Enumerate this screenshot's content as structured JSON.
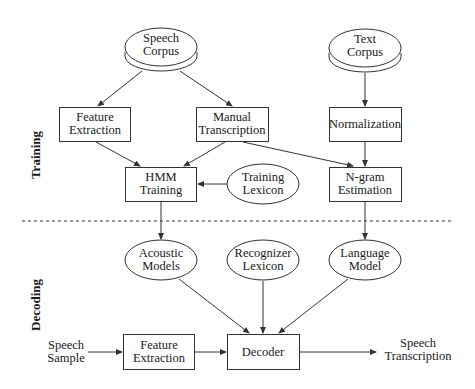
{
  "sections": {
    "training_label": "Training",
    "decoding_label": "Decoding"
  },
  "nodes": {
    "speech_corpus": {
      "line1": "Speech",
      "line2": "Corpus",
      "shape": "cylinder"
    },
    "text_corpus": {
      "line1": "Text",
      "line2": "Corpus",
      "shape": "cylinder"
    },
    "feature_extraction_train": {
      "line1": "Feature",
      "line2": "Extraction",
      "shape": "box"
    },
    "manual_transcription": {
      "line1": "Manual",
      "line2": "Transcription",
      "shape": "box"
    },
    "normalization": {
      "line1": "Normalization",
      "shape": "box"
    },
    "hmm_training": {
      "line1": "HMM",
      "line2": "Training",
      "shape": "box"
    },
    "training_lexicon": {
      "line1": "Training",
      "line2": "Lexicon",
      "shape": "ellipse"
    },
    "ngram_estimation": {
      "line1": "N-gram",
      "line2": "Estimation",
      "shape": "box"
    },
    "acoustic_models": {
      "line1": "Acoustic",
      "line2": "Models",
      "shape": "ellipse"
    },
    "recognizer_lexicon": {
      "line1": "Recognizer",
      "line2": "Lexicon",
      "shape": "ellipse"
    },
    "language_model": {
      "line1": "Language",
      "line2": "Model",
      "shape": "ellipse"
    },
    "speech_sample": {
      "line1": "Speech",
      "line2": "Sample",
      "shape": "text"
    },
    "feature_extraction_decode": {
      "line1": "Feature",
      "line2": "Extraction",
      "shape": "box"
    },
    "decoder": {
      "line1": "Decoder",
      "shape": "box"
    },
    "speech_transcription": {
      "line1": "Speech",
      "line2": "Transcription",
      "shape": "text"
    }
  },
  "edges": [
    [
      "speech_corpus",
      "feature_extraction_train"
    ],
    [
      "speech_corpus",
      "manual_transcription"
    ],
    [
      "text_corpus",
      "normalization"
    ],
    [
      "feature_extraction_train",
      "hmm_training"
    ],
    [
      "manual_transcription",
      "hmm_training"
    ],
    [
      "manual_transcription",
      "ngram_estimation"
    ],
    [
      "training_lexicon",
      "hmm_training"
    ],
    [
      "normalization",
      "ngram_estimation"
    ],
    [
      "hmm_training",
      "acoustic_models"
    ],
    [
      "ngram_estimation",
      "language_model"
    ],
    [
      "acoustic_models",
      "decoder"
    ],
    [
      "recognizer_lexicon",
      "decoder"
    ],
    [
      "language_model",
      "decoder"
    ],
    [
      "speech_sample",
      "feature_extraction_decode"
    ],
    [
      "feature_extraction_decode",
      "decoder"
    ],
    [
      "decoder",
      "speech_transcription"
    ]
  ],
  "colors": {
    "stroke": "#333333",
    "background": "#ffffff"
  }
}
